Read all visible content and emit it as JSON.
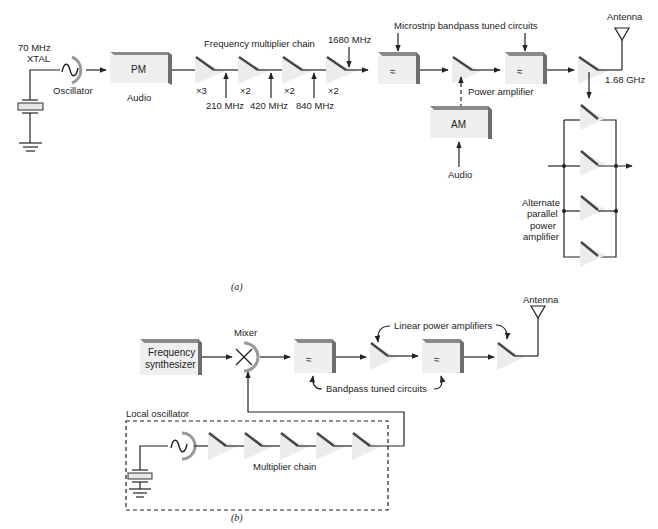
{
  "diagram_a": {
    "caption": "(a)",
    "crystal_label_line1": "70 MHz",
    "crystal_label_line2": "XTAL",
    "oscillator_label": "Oscillator",
    "pm_box_label": "PM",
    "pm_audio_label": "Audio",
    "multiplier_chain_label": "Frequency multiplier chain",
    "multipliers": [
      {
        "factor": "×3",
        "output": "210 MHz"
      },
      {
        "factor": "×2",
        "output": "420 MHz"
      },
      {
        "factor": "×2",
        "output": "840 MHz"
      },
      {
        "factor": "×2",
        "output": "1680 MHz"
      }
    ],
    "filters_label": "Microstrip bandpass tuned circuits",
    "filter_symbol": "≈",
    "power_amplifier_label": "Power amplifier",
    "am_box_label": "AM",
    "am_audio_label": "Audio",
    "antenna_label": "Antenna",
    "output_freq_label": "1.68 GHz",
    "parallel_label_line1": "Alternate",
    "parallel_label_line2": "parallel",
    "parallel_label_line3": "power",
    "parallel_label_line4": "amplifier"
  },
  "diagram_b": {
    "caption": "(b)",
    "synth_label_line1": "Frequency",
    "synth_label_line2": "synthesizer",
    "mixer_label": "Mixer",
    "linear_pa_label": "Linear power amplifiers",
    "bandpass_label": "Bandpass tuned circuits",
    "antenna_label": "Antenna",
    "local_osc_label": "Local oscillator",
    "multiplier_chain_label": "Multiplier chain",
    "filter_symbol": "≈"
  }
}
